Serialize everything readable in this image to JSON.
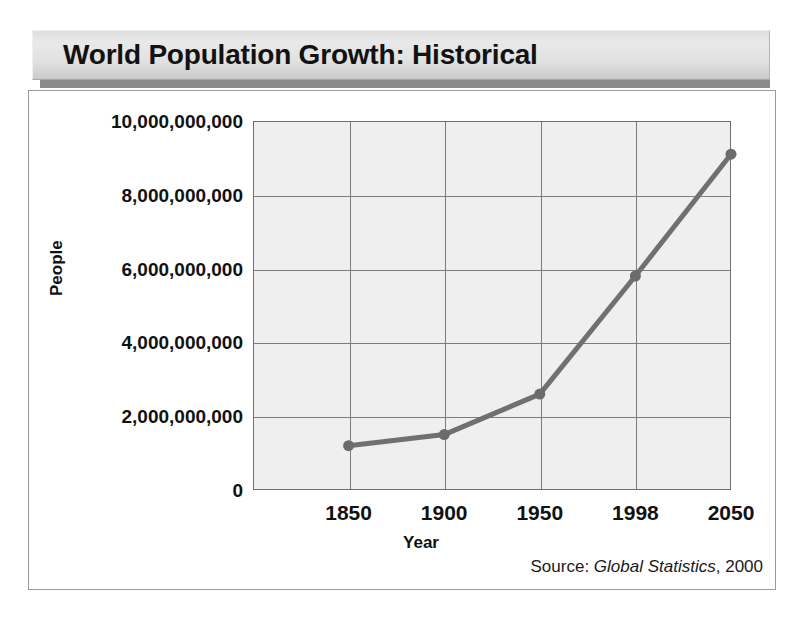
{
  "title": "World Population Growth: Historical",
  "source": {
    "prefix": "Source:",
    "work": "Global Statistics",
    "year": ", 2000"
  },
  "colors": {
    "series_line": "#707070",
    "marker": "#6b6b6b",
    "plot_background": "#efefef",
    "gridline": "#7c7c7c",
    "axis": "#6f6f6f",
    "title_text": "#121212",
    "banner_light": "#e9e9e9",
    "banner_dark": "#c9c9c9",
    "banner_shadow": "#8a8a8a"
  },
  "chart_data": {
    "type": "line",
    "title": "World Population Growth: Historical",
    "xlabel": "Year",
    "ylabel": "People",
    "categories": [
      "1850",
      "1900",
      "1950",
      "1998",
      "2050"
    ],
    "values": [
      1200000000,
      1500000000,
      2600000000,
      5800000000,
      9100000000
    ],
    "ylim": [
      0,
      10000000000
    ],
    "ytick_values": [
      0,
      2000000000,
      4000000000,
      6000000000,
      8000000000,
      10000000000
    ],
    "ytick_labels": [
      "0",
      "2,000,000,000",
      "4,000,000,000",
      "6,000,000,000",
      "8,000,000,000",
      "10,000,000,000"
    ],
    "grid": true,
    "legend": "none",
    "markers": true,
    "series_name": "World population"
  }
}
